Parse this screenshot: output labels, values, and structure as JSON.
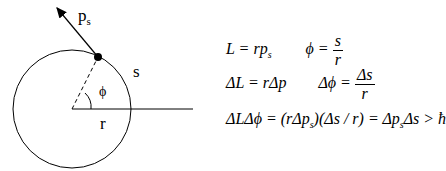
{
  "diagram": {
    "labels": {
      "momentum": "p",
      "momentum_sub": "s",
      "arc": "s",
      "radius": "r",
      "angle": "ϕ"
    }
  },
  "equations": {
    "row1": {
      "left": "L = rp",
      "left_sub": "s",
      "right_lhs": "ϕ =",
      "right_num": "s",
      "right_den": "r"
    },
    "row2": {
      "left": "ΔL = rΔp",
      "right_lhs": "Δϕ =",
      "right_num": "Δs",
      "right_den": "r"
    },
    "row3": {
      "text": "ΔLΔϕ = (rΔp",
      "sub1": "s",
      "mid": ")(Δs / r) = Δp",
      "sub2": "s",
      "end": "Δs > ħ"
    }
  }
}
